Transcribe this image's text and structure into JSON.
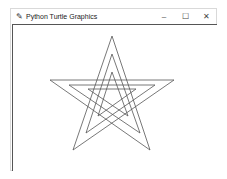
{
  "window": {
    "title": "Python Turtle Graphics",
    "icon": "feather-icon",
    "controls": {
      "minimize": "–",
      "maximize": "☐",
      "close": "✕"
    }
  },
  "canvas": {
    "stroke_color": "#555555",
    "stars": [
      {
        "name": "outer",
        "points": "112,36 150,150 50,80 174,80 73,150 112,36"
      },
      {
        "name": "middle",
        "points": "112,54 140,133 69,85 155,85 86,133 112,54"
      },
      {
        "name": "inner",
        "points": "112,72 128,116 88,89 136,89 98,116 112,72"
      }
    ]
  }
}
